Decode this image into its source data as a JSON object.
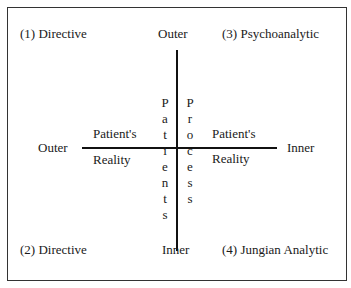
{
  "quadrants": {
    "q1": "(1) Directive",
    "q2": "(2) Directive",
    "q3": "(3) Psychoanalytic",
    "q4": "(4) Jungian Analytic"
  },
  "vertical_axis": {
    "label": "Patients Process",
    "top": "Outer",
    "bottom": "Inner",
    "left_column": [
      "P",
      "a",
      "t",
      "i",
      "e",
      "n",
      "t",
      "s"
    ],
    "right_column": [
      "P",
      "r",
      "o",
      "c",
      "e",
      "s",
      "s"
    ]
  },
  "horizontal_axis": {
    "label": "Patient's Reality",
    "left": "Outer",
    "right": "Inner",
    "left_top": "Patient's",
    "left_bottom": "Reality",
    "right_top": "Patient's",
    "right_bottom": "Reality"
  }
}
